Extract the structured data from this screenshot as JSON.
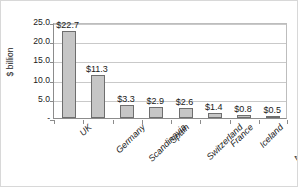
{
  "chart_data": {
    "type": "bar",
    "title": "",
    "xlabel": "",
    "ylabel": "$ billion",
    "categories": [
      "UK",
      "Germany",
      "Scandinavia",
      "Spain",
      "Switzerland",
      "France",
      "Iceland",
      "Netherlands"
    ],
    "values": [
      22.7,
      11.3,
      3.3,
      2.9,
      2.6,
      1.4,
      0.8,
      0.5
    ],
    "data_labels": [
      "$22.7",
      "$11.3",
      "$3.3",
      "$2.9",
      "$2.6",
      "$1.4",
      "$0.8",
      "$0.5"
    ],
    "ylim": [
      0,
      25
    ],
    "ytick_values": [
      25.0,
      20.0,
      15.0,
      10.0,
      5.0,
      0
    ],
    "ytick_labels": [
      "25.0",
      "20.0",
      "15.0",
      "10.0",
      "5.0",
      "-"
    ],
    "grid": true,
    "legend": false,
    "bar_color": "#c6c6c6",
    "bar_border_color": "#6e6e6e",
    "gridline_color": "#c9c9c9",
    "axis_color": "#8c8c8c",
    "text_color": "#1a1a1a"
  }
}
